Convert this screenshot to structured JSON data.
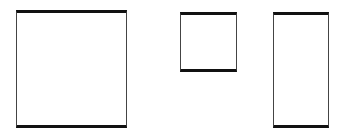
{
  "diagram": {
    "shapes": [
      {
        "id": "square-large",
        "x": 16,
        "y": 10,
        "width": 111,
        "height": 118
      },
      {
        "id": "square-small",
        "x": 180,
        "y": 12,
        "width": 57,
        "height": 60
      },
      {
        "id": "rectangle-tall",
        "x": 273,
        "y": 12,
        "width": 56,
        "height": 116
      }
    ],
    "colors": {
      "thick_edge": "#111111",
      "thin_edge": "#444444",
      "fill": "#ffffff"
    }
  }
}
